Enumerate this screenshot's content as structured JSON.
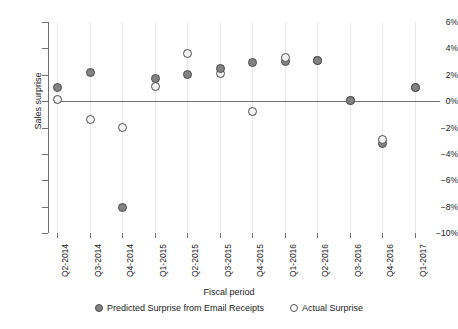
{
  "chart_data": {
    "type": "scatter",
    "title": "",
    "xlabel": "Fiscal period",
    "ylabel": "Sales surprise",
    "categories": [
      "Q2-2014",
      "Q3-2014",
      "Q4-2014",
      "Q1-2015",
      "Q2-2015",
      "Q3-2015",
      "Q4-2015",
      "Q1-2016",
      "Q2-2016",
      "Q3-2016",
      "Q4-2016",
      "Q1-2017"
    ],
    "ylim": [
      -10,
      6
    ],
    "ytick_values": [
      6,
      4,
      2,
      0,
      -2,
      -4,
      -6,
      -8,
      -10
    ],
    "ytick_labels": [
      "6%",
      "4%",
      "2%",
      "0%",
      "-2%",
      "-4%",
      "-6%",
      "-8%",
      "-10%"
    ],
    "grid": "vertical",
    "legend_position": "bottom",
    "series": [
      {
        "name": "Predicted Surprise from Email Receipts",
        "marker": "filled-circle",
        "color": "#828282",
        "values": [
          1.0,
          2.2,
          -8.1,
          1.7,
          2.0,
          2.5,
          2.9,
          3.0,
          3.1,
          0.05,
          -3.2,
          1.0
        ]
      },
      {
        "name": "Actual Surprise",
        "marker": "open-circle",
        "color": "#f2f2f2",
        "values": [
          0.1,
          -1.4,
          -2.0,
          1.1,
          3.6,
          2.1,
          -0.8,
          3.3,
          3.1,
          0.05,
          -2.9,
          1.0
        ]
      }
    ]
  },
  "axes": {
    "y_title": "Sales surprise",
    "x_title": "Fiscal period"
  },
  "legend": {
    "entries": [
      {
        "label": "Predicted Surprise from Email Receipts",
        "style": "predicted"
      },
      {
        "label": "Actual Surprise",
        "style": "actual"
      }
    ]
  },
  "footer": {
    "fragment": ""
  }
}
